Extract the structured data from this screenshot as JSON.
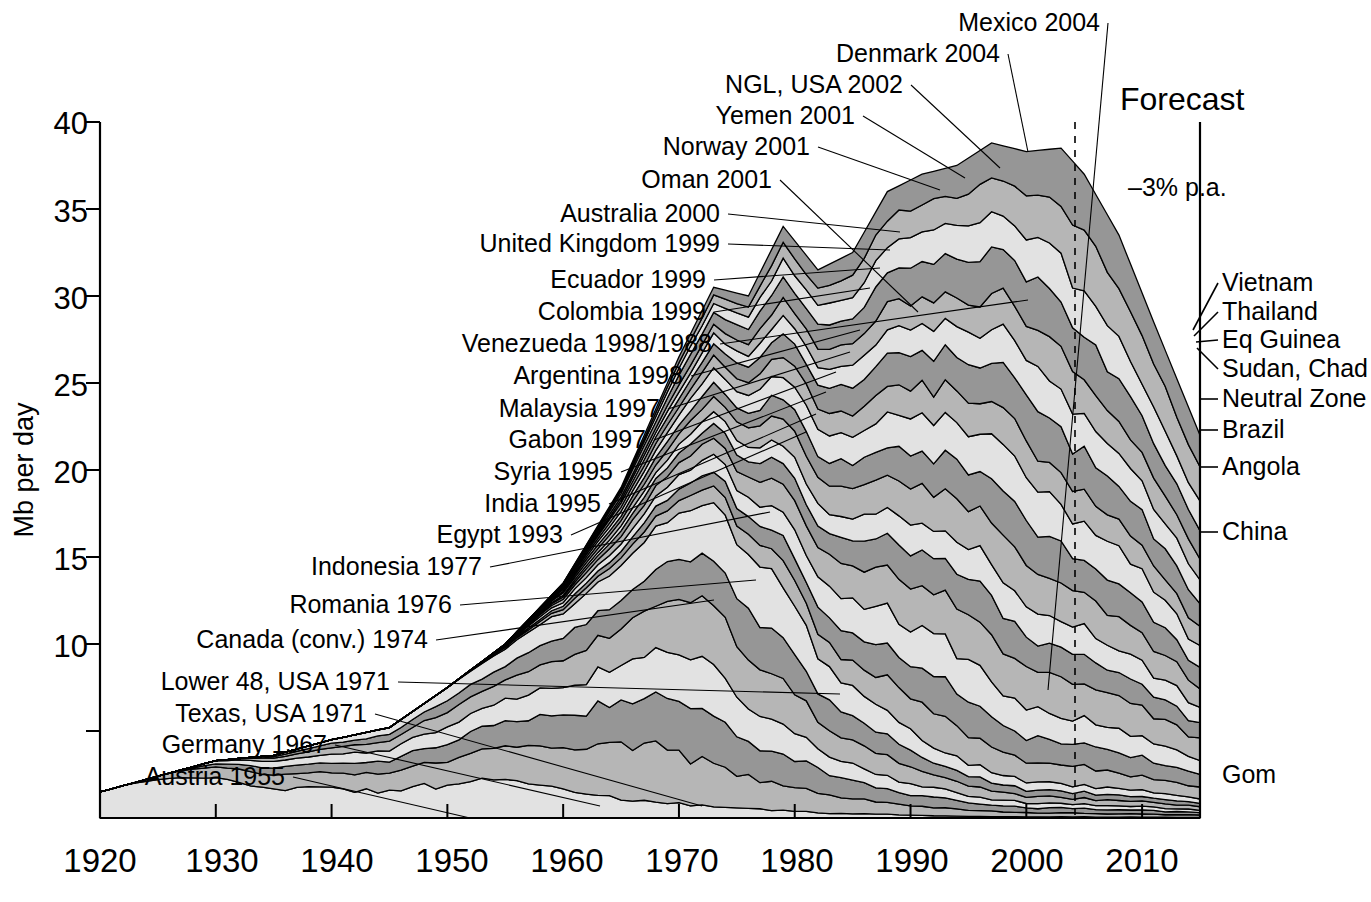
{
  "chart_data": {
    "type": "area",
    "title": "",
    "subtitle": "",
    "xlabel": "",
    "ylabel": "Mb per day",
    "xlim": [
      1920,
      2015
    ],
    "ylim": [
      0,
      40
    ],
    "grid": false,
    "legend_position": "inline-annotations",
    "xticks": [
      1920,
      1930,
      1940,
      1950,
      1960,
      1970,
      1980,
      1990,
      2000,
      2010
    ],
    "yticks": [
      5,
      10,
      15,
      20,
      25,
      30,
      35,
      40
    ],
    "ytick_labels": [
      "",
      "10",
      "15",
      "20",
      "25",
      "30",
      "35",
      "40"
    ],
    "annotations": {
      "forecast_label": "Forecast",
      "forecast_year": 2006,
      "decline_rate": "–3% p.a.",
      "bottom_right_label": "Gom"
    },
    "x": [
      1920,
      1925,
      1930,
      1935,
      1940,
      1945,
      1950,
      1955,
      1960,
      1965,
      1970,
      1973,
      1976,
      1979,
      1982,
      1985,
      1988,
      1991,
      1994,
      1997,
      2000,
      2003,
      2005,
      2008,
      2011,
      2015
    ],
    "total_values": [
      1.5,
      2.4,
      3.3,
      3.6,
      4.5,
      5.2,
      7.5,
      10.0,
      13.5,
      19.0,
      26.5,
      30.5,
      30.0,
      34.0,
      31.5,
      32.5,
      36.0,
      37.0,
      37.5,
      38.8,
      38.3,
      38.5,
      37.0,
      33.5,
      28.5,
      22.0
    ],
    "series": [
      {
        "name": "Austria 1955",
        "peak_year": 1955,
        "tone": "light"
      },
      {
        "name": "Germany 1967",
        "peak_year": 1967,
        "tone": "mid"
      },
      {
        "name": "Texas, USA 1971",
        "peak_year": 1971,
        "tone": "dark"
      },
      {
        "name": "Lower 48, USA 1971",
        "peak_year": 1971,
        "tone": "light"
      },
      {
        "name": "Canada (conv.) 1974",
        "peak_year": 1974,
        "tone": "mid"
      },
      {
        "name": "Romania 1976",
        "peak_year": 1976,
        "tone": "dark"
      },
      {
        "name": "Indonesia 1977",
        "peak_year": 1977,
        "tone": "light"
      },
      {
        "name": "Egypt 1993",
        "peak_year": 1993,
        "tone": "mid"
      },
      {
        "name": "India 1995",
        "peak_year": 1995,
        "tone": "dark"
      },
      {
        "name": "Syria 1995",
        "peak_year": 1995,
        "tone": "light"
      },
      {
        "name": "Gabon 1997",
        "peak_year": 1997,
        "tone": "mid"
      },
      {
        "name": "Malaysia 1997",
        "peak_year": 1997,
        "tone": "dark"
      },
      {
        "name": "Argentina 1998",
        "peak_year": 1998,
        "tone": "light"
      },
      {
        "name": "Venezueda 1998/1988",
        "peak_year": 1998,
        "tone": "mid"
      },
      {
        "name": "Colombia 1999",
        "peak_year": 1999,
        "tone": "dark"
      },
      {
        "name": "Ecuador 1999",
        "peak_year": 1999,
        "tone": "light"
      },
      {
        "name": "United Kingdom 1999",
        "peak_year": 1999,
        "tone": "mid"
      },
      {
        "name": "Australia 2000",
        "peak_year": 2000,
        "tone": "dark"
      },
      {
        "name": "Oman 2001",
        "peak_year": 2001,
        "tone": "light"
      },
      {
        "name": "Norway 2001",
        "peak_year": 2001,
        "tone": "mid"
      },
      {
        "name": "Yemen 2001",
        "peak_year": 2001,
        "tone": "dark"
      },
      {
        "name": "NGL, USA 2002",
        "peak_year": 2002,
        "tone": "light"
      },
      {
        "name": "Denmark 2004",
        "peak_year": 2004,
        "tone": "mid"
      },
      {
        "name": "Mexico 2004",
        "peak_year": 2004,
        "tone": "dark"
      }
    ],
    "right_labels": [
      "Vietnam",
      "Thailand",
      "Eq Guinea",
      "Sudan, Chad",
      "Neutral Zone",
      "Brazil",
      "Angola",
      "China"
    ],
    "left_labels": [
      "Mexico 2004",
      "Denmark 2004",
      "NGL, USA 2002",
      "Yemen 2001",
      "Norway 2001",
      "Oman 2001",
      "Australia 2000",
      "United Kingdom 1999",
      "Ecuador 1999",
      "Colombia 1999",
      "Venezueda 1998/1988",
      "Argentina 1998",
      "Malaysia 1997",
      "Gabon 1997",
      "Syria 1995",
      "India 1995",
      "Egypt 1993",
      "Indonesia 1977",
      "Romania 1976",
      "Canada (conv.) 1974",
      "Lower 48, USA 1971",
      "Texas, USA 1971",
      "Germany 1967",
      "Austria 1955"
    ],
    "colors": {
      "light": "#e2e2e2",
      "mid": "#b6b6b6",
      "dark": "#969696",
      "outline": "#000000",
      "background": "#ffffff"
    }
  },
  "axis": {
    "y_title": "Mb per day",
    "y_labels": {
      "t40": "40",
      "t35": "35",
      "t30": "30",
      "t25": "25",
      "t20": "20",
      "t15": "15",
      "t10": "10"
    },
    "x_labels": {
      "x1920": "1920",
      "x1930": "1930",
      "x1940": "1940",
      "x1950": "1950",
      "x1960": "1960",
      "x1970": "1970",
      "x1980": "1980",
      "x1990": "1990",
      "x2000": "2000",
      "x2010": "2010"
    }
  },
  "callouts": {
    "mexico": "Mexico 2004",
    "denmark": "Denmark 2004",
    "ngl_usa": "NGL, USA 2002",
    "yemen": "Yemen 2001",
    "norway": "Norway 2001",
    "oman": "Oman 2001",
    "australia": "Australia 2000",
    "uk": "United Kingdom 1999",
    "ecuador": "Ecuador 1999",
    "colombia": "Colombia 1999",
    "venezuela": "Venezueda 1998/1988",
    "argentina": "Argentina 1998",
    "malaysia": "Malaysia 1997",
    "gabon": "Gabon 1997",
    "syria": "Syria 1995",
    "india": "India 1995",
    "egypt": "Egypt 1993",
    "indonesia": "Indonesia 1977",
    "romania": "Romania 1976",
    "canada": "Canada (conv.) 1974",
    "lower48": "Lower 48, USA 1971",
    "texas": "Texas, USA 1971",
    "germany": "Germany 1967",
    "austria": "Austria 1955"
  },
  "right_callouts": {
    "vietnam": "Vietnam",
    "thailand": "Thailand",
    "eq_guinea": "Eq Guinea",
    "sudan_chad": "Sudan, Chad",
    "neutral_zone": "Neutral Zone",
    "brazil": "Brazil",
    "angola": "Angola",
    "china": "China",
    "gom": "Gom"
  },
  "forecast": {
    "label": "Forecast",
    "decline": "–3% p.a."
  }
}
